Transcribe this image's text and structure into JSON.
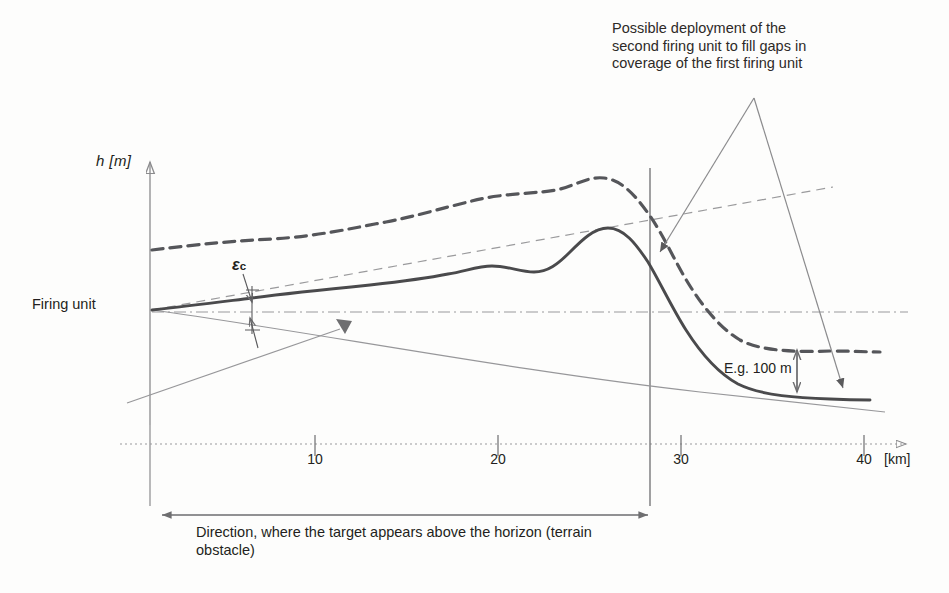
{
  "figure": {
    "type": "technical-diagram",
    "title_annotation": "Possible deployment of the\nsecond firing unit to fill gaps in\ncoverage of the first firing unit",
    "firing_unit_label": "Firing unit",
    "epsilon_symbol": "ε",
    "epsilon_subscript": "c",
    "height_example_label": "E.g. 100 m",
    "direction_caption": "Direction, where the target appears above the horizon (terrain obstacle)"
  },
  "axes": {
    "y_label": "h [m]",
    "x_unit": "[km]",
    "x_ticks": [
      {
        "label": "10",
        "value": 10,
        "x": 315
      },
      {
        "label": "20",
        "value": 20,
        "x": 498
      },
      {
        "label": "30",
        "value": 30,
        "x": 681
      },
      {
        "label": "40",
        "value": 40,
        "x": 864
      }
    ],
    "x_range_km": [
      0,
      42
    ],
    "x_origin_px": 132,
    "px_per_10km": 183,
    "grid": false
  },
  "chart_data": {
    "type": "line",
    "xlabel": "[km]",
    "ylabel": "h [m]",
    "xlim": [
      0,
      42
    ],
    "legend": "none",
    "series": [
      {
        "name": "upper-dashed-coverage-boundary",
        "style": "dashed-thick",
        "color": "#55565a",
        "points": "M 152,250 C 200,244 235,241 272,239 C 320,236 352,228 386,222 C 412,217 432,211 452,206 C 468,202 482,198 498,196 C 520,193 540,193 556,190 C 575,186 588,176 604,178 C 622,180 636,196 650,216 C 664,236 676,264 690,286 C 704,308 720,328 740,340 C 762,352 800,352 830,351 C 852,351 868,352 880,352"
      },
      {
        "name": "terrain-profile-solid",
        "style": "solid-thick",
        "color": "#4a4a4c",
        "points": "M 152,310 C 190,306 220,302 252,298 C 290,293 330,289 370,285 C 406,281 428,278 448,274 C 466,271 478,266 492,266 C 508,266 520,272 534,272 C 548,272 558,264 570,252 C 582,240 594,228 608,228 C 624,228 636,244 648,262 C 660,282 672,308 686,330 C 700,352 716,372 738,384 C 762,396 800,398 830,399 C 850,400 862,400 870,400"
      },
      {
        "name": "thin-rising-sight-line",
        "style": "dashed-thin",
        "color": "#8b8b8d",
        "points": "M 152,310 L 833,187"
      },
      {
        "name": "thin-descending-line",
        "style": "solid-thin",
        "color": "#8b8b8d",
        "points": "M 152,310 C 300,330 520,372 700,392 C 790,402 850,408 885,412"
      },
      {
        "name": "horizon-dash-dot-line",
        "style": "dash-dot",
        "color": "#9a9a9c",
        "points": "M 152,312 L 908,312"
      },
      {
        "name": "lower-left-rising-line",
        "style": "solid-thin",
        "color": "#8b8b8d",
        "points": "M 127,403 L 345,327"
      }
    ]
  },
  "markers": {
    "leader_apex": {
      "x": 754,
      "y": 98
    },
    "leader_left_arrow": {
      "x": 655,
      "y": 258
    },
    "leader_right_arrow": {
      "x": 845,
      "y": 396
    },
    "gap_arrow": {
      "x": 345,
      "y": 328
    },
    "height_arrow": {
      "x": 797,
      "y_top": 348,
      "y_bottom": 392
    },
    "span_arrow": {
      "x_left": 160,
      "x_right": 648,
      "y": 515
    },
    "boundary_line_x": 650
  },
  "colors": {
    "ink": "#231f20",
    "line_dark": "#4a4a4c",
    "line_mid": "#6e6e70",
    "line_light": "#9a9a9c",
    "background": "#fdfdfc"
  }
}
